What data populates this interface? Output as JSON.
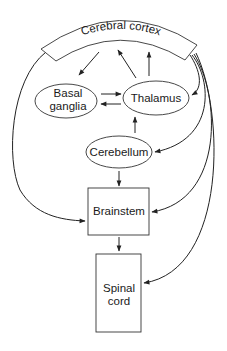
{
  "diagram": {
    "type": "flow",
    "nodes": [
      {
        "id": "cortex",
        "label": "Cerebral cortex",
        "shape": "arc-band"
      },
      {
        "id": "basal_ganglia",
        "label_line1": "Basal",
        "label_line2": "ganglia",
        "shape": "ellipse"
      },
      {
        "id": "thalamus",
        "label": "Thalamus",
        "shape": "ellipse"
      },
      {
        "id": "cerebellum",
        "label": "Cerebellum",
        "shape": "ellipse"
      },
      {
        "id": "brainstem",
        "label": "Brainstem",
        "shape": "rectangle"
      },
      {
        "id": "spinal_cord",
        "label_line1": "Spinal",
        "label_line2": "cord",
        "shape": "rectangle"
      }
    ],
    "edges": [
      {
        "from": "cortex",
        "to": "basal_ganglia"
      },
      {
        "from": "thalamus",
        "to": "cortex"
      },
      {
        "from": "thalamus",
        "to": "cortex"
      },
      {
        "from": "basal_ganglia",
        "to": "thalamus"
      },
      {
        "from": "thalamus",
        "to": "basal_ganglia"
      },
      {
        "from": "cerebellum",
        "to": "thalamus"
      },
      {
        "from": "cortex",
        "to": "thalamus"
      },
      {
        "from": "cortex",
        "to": "cerebellum"
      },
      {
        "from": "cerebellum",
        "to": "brainstem"
      },
      {
        "from": "cortex",
        "to": "brainstem",
        "side": "left"
      },
      {
        "from": "cortex",
        "to": "brainstem",
        "side": "right"
      },
      {
        "from": "brainstem",
        "to": "spinal_cord"
      },
      {
        "from": "cortex",
        "to": "spinal_cord"
      }
    ],
    "colors": {
      "line": "#222222",
      "fill": "#ffffff",
      "text": "#1a1a1a"
    }
  }
}
